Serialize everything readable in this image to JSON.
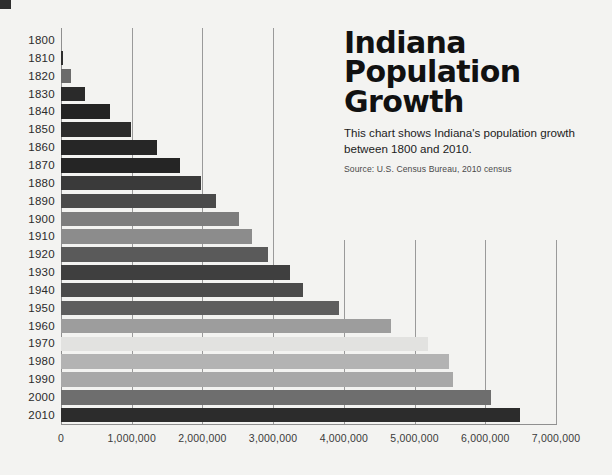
{
  "title_lines": [
    "Indiana",
    "Population",
    "Growth"
  ],
  "subtitle": "This chart shows Indiana's population growth between 1800 and 2010.",
  "source": "Source: U.S. Census Bureau, 2010 census",
  "chart_data": {
    "type": "bar",
    "orientation": "horizontal",
    "title": "Indiana Population Growth",
    "subtitle": "This chart shows Indiana's population growth between 1800 and 2010.",
    "source": "Source: U.S. Census Bureau, 2010 census",
    "xlabel": "",
    "ylabel": "",
    "xlim": [
      0,
      7000000
    ],
    "grid": true,
    "legend": "none",
    "xticks": [
      0,
      1000000,
      2000000,
      3000000,
      4000000,
      5000000,
      6000000,
      7000000
    ],
    "xtick_labels": [
      "0",
      "1,000,000",
      "2,000,000",
      "3,000,000",
      "4,000,000",
      "5,000,000",
      "6,000,000",
      "7,000,000"
    ],
    "categories": [
      "1800",
      "1810",
      "1820",
      "1830",
      "1840",
      "1850",
      "1860",
      "1870",
      "1880",
      "1890",
      "1900",
      "1910",
      "1920",
      "1930",
      "1940",
      "1950",
      "1960",
      "1970",
      "1980",
      "1990",
      "2000",
      "2010"
    ],
    "values": [
      0,
      24520,
      147178,
      343031,
      685866,
      988416,
      1350428,
      1680637,
      1978301,
      2192404,
      2516462,
      2700876,
      2930390,
      3238503,
      3427796,
      3934224,
      4662498,
      5193669,
      5490224,
      5544159,
      6080485,
      6483802
    ],
    "bar_colors": [
      "#f3f3f1",
      "#2f2f2f",
      "#6b6b6b",
      "#2a2a2a",
      "#232323",
      "#2b2b2b",
      "#262626",
      "#252525",
      "#3a3a3a",
      "#4a4a4a",
      "#7d7d7d",
      "#8c8c8c",
      "#5a5a5a",
      "#3f3f3f",
      "#4b4b4b",
      "#5e5e5e",
      "#9d9d9d",
      "#e2e2e0",
      "#b3b3b3",
      "#a8a8a8",
      "#6e6e6e",
      "#2c2c2c"
    ]
  }
}
